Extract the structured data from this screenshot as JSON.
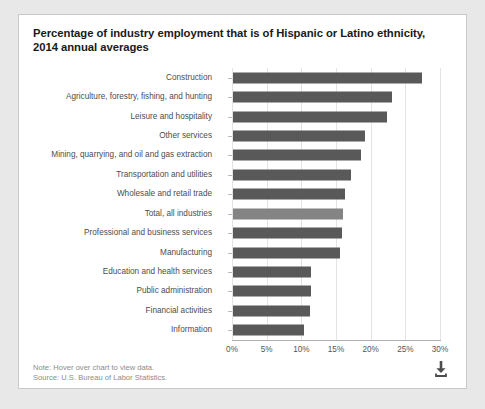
{
  "chart_data": {
    "type": "bar",
    "orientation": "horizontal",
    "title": "Percentage of industry employment that is of Hispanic or Latino ethnicity, 2014 annual averages",
    "xlabel": "",
    "ylabel": "",
    "xlim": [
      0,
      30
    ],
    "xticks": [
      "0%",
      "5%",
      "10%",
      "15%",
      "20%",
      "25%",
      "30%"
    ],
    "xtick_values": [
      0,
      5,
      10,
      15,
      20,
      25,
      30
    ],
    "grid": true,
    "legend": "none",
    "categories": [
      "Construction",
      "Agriculture, forestry, fishing, and hunting",
      "Leisure and hospitality",
      "Other services",
      "Mining, quarrying, and oil and gas extraction",
      "Transportation and utilities",
      "Wholesale and retail trade",
      "Total, all industries",
      "Professional and business services",
      "Manufacturing",
      "Education and health services",
      "Public administration",
      "Financial activities",
      "Information"
    ],
    "values": [
      27.2,
      23.0,
      22.2,
      19.0,
      18.5,
      17.0,
      16.2,
      15.8,
      15.7,
      15.5,
      11.3,
      11.2,
      11.1,
      10.3
    ],
    "bar_colors": [
      "#595959",
      "#595959",
      "#595959",
      "#595959",
      "#595959",
      "#595959",
      "#595959",
      "#848484",
      "#595959",
      "#595959",
      "#595959",
      "#595959",
      "#595959",
      "#595959"
    ],
    "highlight_category": "Total, all industries"
  },
  "footer": {
    "note": "Note: Hover over chart to view data.",
    "source": "Source: U.S. Bureau of Labor Statistics."
  },
  "icons": {
    "download": "download-icon"
  }
}
